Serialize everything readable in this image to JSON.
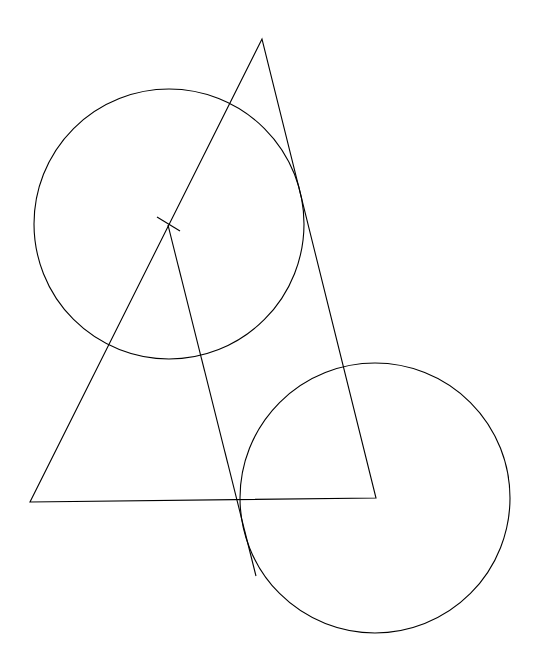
{
  "diagram": {
    "background": "#ffffff",
    "stroke": "#000000",
    "triangle": {
      "points": [
        [
          262,
          39
        ],
        [
          30,
          502
        ],
        [
          376,
          498
        ]
      ]
    },
    "circle_upper": {
      "cx": 169,
      "cy": 224,
      "r": 135
    },
    "circle_lower": {
      "cx": 375,
      "cy": 498,
      "r": 135
    },
    "tick_segment": {
      "x1": 157,
      "y1": 217,
      "x2": 180,
      "y2": 231
    },
    "ray_segment": {
      "x1": 168,
      "y1": 225,
      "x2": 256,
      "y2": 576
    }
  }
}
